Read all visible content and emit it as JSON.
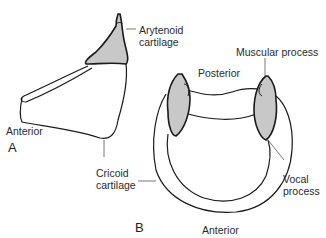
{
  "figure": {
    "panel_a": {
      "letter": "A",
      "labels": {
        "arytenoid_line1": "Arytenoid",
        "arytenoid_line2": "cartilage",
        "anterior": "Anterior",
        "cricoid_line1": "Cricoid",
        "cricoid_line2": "cartilage"
      }
    },
    "panel_b": {
      "letter": "B",
      "labels": {
        "muscular_process": "Muscular process",
        "posterior": "Posterior",
        "vocal_line1": "Vocal",
        "vocal_line2": "process",
        "anterior": "Anterior"
      }
    },
    "colors": {
      "cartilage_fill": "#c8c8c8",
      "outline": "#1a1a1a",
      "leader_line": "#555555"
    }
  }
}
